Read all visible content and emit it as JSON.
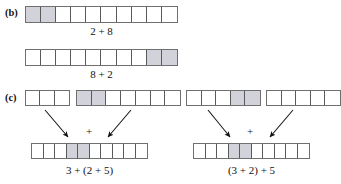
{
  "figure": {
    "parts": [
      {
        "id": "b",
        "label": "(b)",
        "rows": [
          {
            "name": "two-plus-eight",
            "cells": 10,
            "shaded_indices": [
              0,
              1
            ],
            "caption": "2 + 8"
          },
          {
            "name": "eight-plus-two",
            "cells": 10,
            "shaded_indices": [
              8,
              9
            ],
            "caption": "8 + 2"
          }
        ]
      },
      {
        "id": "c",
        "label": "(c)",
        "top_bars": [
          {
            "name": "bar-three",
            "cells": 3,
            "shaded_indices": []
          },
          {
            "name": "bar-two-plus-five",
            "cells": 7,
            "shaded_indices": [
              0,
              1
            ]
          },
          {
            "name": "bar-three-plus-two",
            "cells": 5,
            "shaded_indices": [
              3,
              4
            ]
          },
          {
            "name": "bar-five",
            "cells": 5,
            "shaded_indices": []
          }
        ],
        "operators": [
          "+",
          "+"
        ],
        "result_bars": [
          {
            "name": "result-left",
            "cells": 10,
            "shaded_indices": [
              3,
              4
            ],
            "caption": "3 + (2 + 5)"
          },
          {
            "name": "result-right",
            "cells": 10,
            "shaded_indices": [
              3,
              4
            ],
            "caption": "(3 + 2) + 5"
          }
        ]
      }
    ]
  },
  "colors": {
    "shaded_cell": "#d2d2da",
    "cell_border": "#5a5a5a",
    "bar_border": "#6f6f6f",
    "text": "#111111",
    "background": "#ffffff"
  }
}
